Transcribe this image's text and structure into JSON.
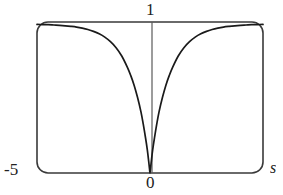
{
  "chart_data": {
    "type": "line",
    "title": "",
    "subtitle": "",
    "xlabel": "s",
    "ylabel": "",
    "xlim": [
      -5,
      5
    ],
    "ylim": [
      0,
      1
    ],
    "grid": false,
    "legend": null,
    "annotations": [],
    "tick_labels": {
      "y_max": "1",
      "x_min": "-5",
      "origin": "0",
      "x_var": "s"
    },
    "series": [
      {
        "name": "curve",
        "color": "#1a1a1a",
        "x": [
          -5.0,
          -4.75,
          -4.5,
          -4.25,
          -4.0,
          -3.75,
          -3.5,
          -3.25,
          -3.0,
          -2.75,
          -2.5,
          -2.25,
          -2.0,
          -1.75,
          -1.5,
          -1.25,
          -1.0,
          -0.85,
          -0.7,
          -0.55,
          -0.4,
          -0.3,
          -0.2,
          -0.12,
          -0.06,
          -0.02,
          0.0,
          0.02,
          0.06,
          0.12,
          0.2,
          0.3,
          0.4,
          0.55,
          0.7,
          0.85,
          1.0,
          1.25,
          1.5,
          1.75,
          2.0,
          2.25,
          2.5,
          2.75,
          3.0,
          3.25,
          3.5,
          3.75,
          4.0,
          4.25,
          4.5,
          4.75,
          5.0
        ],
        "y": [
          0.984,
          0.983,
          0.982,
          0.98,
          0.978,
          0.975,
          0.971,
          0.966,
          0.959,
          0.95,
          0.938,
          0.922,
          0.9,
          0.87,
          0.83,
          0.775,
          0.7,
          0.645,
          0.58,
          0.5,
          0.405,
          0.325,
          0.235,
          0.155,
          0.08,
          0.025,
          0.0,
          0.025,
          0.08,
          0.155,
          0.235,
          0.325,
          0.405,
          0.5,
          0.58,
          0.645,
          0.7,
          0.775,
          0.83,
          0.87,
          0.9,
          0.922,
          0.938,
          0.95,
          0.959,
          0.966,
          0.971,
          0.975,
          0.978,
          0.98,
          0.982,
          0.983,
          0.984
        ]
      }
    ],
    "vertical_axis_line": {
      "x": 0,
      "color": "#555555"
    },
    "frame": {
      "style": "rounded-rectangle",
      "color": "#3a3a3a"
    }
  },
  "geometry": {
    "plot_left": 37,
    "plot_right": 263,
    "plot_top": 22,
    "plot_bottom": 173,
    "corner_radius": 11
  }
}
